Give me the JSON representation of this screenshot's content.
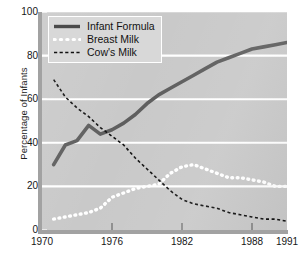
{
  "chart_data": {
    "type": "line",
    "title": "",
    "xlabel": "",
    "ylabel": "Percentage of Infants",
    "xlim": [
      1970,
      1991
    ],
    "ylim": [
      0,
      100
    ],
    "grid": "horizontal white gridlines at every 20 percent",
    "legend_position": "upper left inside plot",
    "y_ticks": [
      "100",
      "80",
      "60",
      "40",
      "20",
      "0"
    ],
    "y_tick_values": [
      100,
      80,
      60,
      40,
      20,
      0
    ],
    "x_ticks": [
      "1970",
      "1976",
      "1982",
      "1988",
      "1991"
    ],
    "x_tick_values": [
      1970,
      1976,
      1982,
      1988,
      1991
    ],
    "series": [
      {
        "name": "Infant Formula",
        "style": "solid",
        "color": "#5e5e5e",
        "x": [
          1971,
          1972,
          1973,
          1974,
          1975,
          1976,
          1977,
          1978,
          1979,
          1980,
          1981,
          1982,
          1983,
          1984,
          1985,
          1986,
          1987,
          1988,
          1989,
          1990,
          1991
        ],
        "values": [
          30,
          39,
          41,
          48,
          44,
          46,
          49,
          53,
          58,
          62,
          65,
          68,
          71,
          74,
          77,
          79,
          81,
          83,
          84,
          85,
          86
        ]
      },
      {
        "name": "Breast Milk",
        "style": "dotted",
        "color": "#ffffff",
        "x": [
          1971,
          1972,
          1973,
          1974,
          1975,
          1976,
          1977,
          1978,
          1979,
          1980,
          1981,
          1982,
          1983,
          1984,
          1985,
          1986,
          1987,
          1988,
          1989,
          1990,
          1991
        ],
        "values": [
          5,
          6,
          7,
          8,
          10,
          15,
          17,
          19,
          20,
          21,
          26,
          29,
          30,
          28,
          26,
          24,
          24,
          23,
          22,
          20,
          20
        ]
      },
      {
        "name": "Cow's Milk",
        "style": "dashed",
        "color": "#111111",
        "x": [
          1971,
          1972,
          1973,
          1974,
          1975,
          1976,
          1977,
          1978,
          1979,
          1980,
          1981,
          1982,
          1983,
          1984,
          1985,
          1986,
          1987,
          1988,
          1989,
          1990,
          1991
        ],
        "values": [
          69,
          61,
          56,
          52,
          47,
          43,
          39,
          33,
          28,
          23,
          18,
          14,
          12,
          11,
          10,
          8,
          7,
          6,
          5,
          5,
          4
        ]
      }
    ]
  },
  "axes": {
    "y_label": "Percentage of Infants",
    "y_ticks": [
      {
        "label": "100",
        "value": 100
      },
      {
        "label": "80",
        "value": 80
      },
      {
        "label": "60",
        "value": 60
      },
      {
        "label": "40",
        "value": 40
      },
      {
        "label": "20",
        "value": 20
      },
      {
        "label": "0",
        "value": 0
      }
    ],
    "x_ticks": [
      {
        "label": "1970",
        "value": 1970
      },
      {
        "label": "1976",
        "value": 1976
      },
      {
        "label": "1982",
        "value": 1982
      },
      {
        "label": "1988",
        "value": 1988
      },
      {
        "label": "1991",
        "value": 1991
      }
    ]
  },
  "legend": {
    "items": [
      {
        "label": "Infant Formula",
        "style": "solid",
        "color": "#5e5e5e"
      },
      {
        "label": "Breast Milk",
        "style": "dotted",
        "color": "#ffffff"
      },
      {
        "label": "Cow's Milk",
        "style": "dashed",
        "color": "#111111"
      }
    ]
  },
  "colors": {
    "plot_background": "#c9c9c9",
    "gridline": "#ffffff",
    "spine": "#a2a2a2",
    "page_background": "#ffffff",
    "text": "#161616"
  }
}
